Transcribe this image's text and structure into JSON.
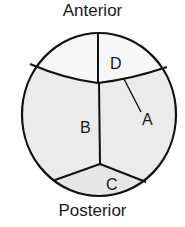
{
  "diagram": {
    "top_label": "Anterior",
    "bottom_label": "Posterior",
    "regions": [
      {
        "id": "A",
        "label": "A",
        "x": 147,
        "y": 124
      },
      {
        "id": "B",
        "label": "B",
        "x": 86,
        "y": 132
      },
      {
        "id": "C",
        "label": "C",
        "x": 112,
        "y": 189
      },
      {
        "id": "D",
        "label": "D",
        "x": 115,
        "y": 68
      }
    ],
    "colors": {
      "stroke": "#111111",
      "upper_fill": "#f6f6f6",
      "middle_fill": "#ebebeb",
      "lower_fill": "#e6e6e6"
    }
  }
}
